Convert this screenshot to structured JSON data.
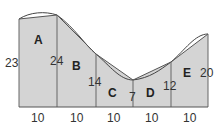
{
  "diagram": {
    "type": "trapezoid-rule-area",
    "fill_color": "#d4d4d4",
    "stroke_color": "#555555",
    "curve_color": "#444444",
    "strips": [
      {
        "label": "A",
        "width_label": "10"
      },
      {
        "label": "B",
        "width_label": "10"
      },
      {
        "label": "C",
        "width_label": "10"
      },
      {
        "label": "D",
        "width_label": "10"
      },
      {
        "label": "E",
        "width_label": "10"
      }
    ],
    "heights": [
      "23",
      "24",
      "14",
      "7",
      "12",
      "20"
    ]
  }
}
